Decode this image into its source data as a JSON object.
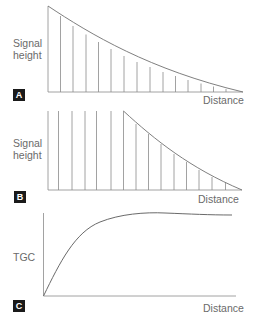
{
  "panels": {
    "a": {
      "badge": "A",
      "ylabel_line1": "Signal",
      "ylabel_line2": "height",
      "xlabel": "Distance",
      "description": "Exponentially decaying signal height with distance (uncompensated echoes)"
    },
    "b": {
      "badge": "B",
      "ylabel_line1": "Signal",
      "ylabel_line2": "height",
      "xlabel": "Distance",
      "description": "Equal signal heights in near field, then decay beyond compensation range"
    },
    "c": {
      "badge": "C",
      "ylabel": "TGC",
      "xlabel": "Distance",
      "description": "Time gain compensation curve rising with distance then plateauing"
    }
  },
  "colors": {
    "line": "#8a8a8a",
    "curve": "#707070",
    "badge_bg": "#1a1a1a",
    "text": "#6a6a6a"
  }
}
